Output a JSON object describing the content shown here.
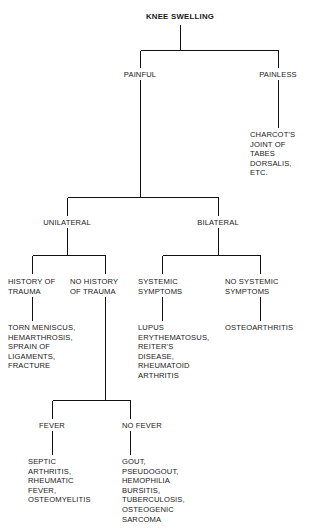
{
  "diagram": {
    "title": "KNEE SWELLING",
    "type": "clinical-decision-flowchart",
    "line_color": "#111111",
    "background_color": "#ffffff"
  },
  "nodes": {
    "root": "KNEE SWELLING",
    "painful": "PAINFUL",
    "painless": "PAINLESS",
    "charcot": "CHARCOT'S\nJOINT OF\nTABES\nDORSALIS,\nETC.",
    "unilateral": "UNILATERAL",
    "bilateral": "BILATERAL",
    "history_of_trauma": "HISTORY OF\nTRAUMA",
    "no_history_of_trauma": "NO HISTORY\nOF TRAUMA",
    "systemic_symptoms": "SYSTEMIC\nSYMPTOMS",
    "no_systemic_symptoms": "NO SYSTEMIC\nSYMPTOMS",
    "trauma_causes": "TORN MENISCUS,\nHEMARTHROSIS,\nSPRAIN OF\nLIGAMENTS,\nFRACTURE",
    "systemic_causes": "LUPUS\nERYTHEMATOSUS,\nREITER'S\nDISEASE,\nRHEUMATOID\nARTHRITIS",
    "no_systemic_causes": "OSTEOARTHRITIS",
    "fever": "FEVER",
    "no_fever": "NO FEVER",
    "fever_causes": "SEPTIC\nARTHRITIS,\nRHEUMATIC\nFEVER,\nOSTEOMYELITIS",
    "no_fever_causes": "GOUT,\nPSEUDOGOUT,\nHEMOPHILIA\nBURSITIS,\nTUBERCULOSIS,\nOSTEOGENIC\nSARCOMA"
  }
}
